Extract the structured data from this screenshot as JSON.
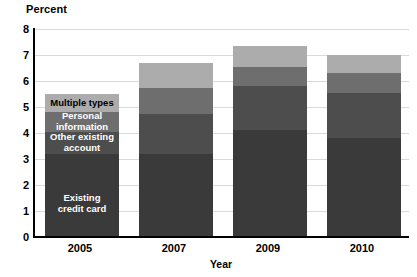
{
  "chart_data": {
    "type": "bar",
    "subtype": "stacked-vertical",
    "title": "",
    "xlabel": "Year",
    "ylabel": "Percent",
    "categories": [
      "2005",
      "2007",
      "2009",
      "2010"
    ],
    "ylim": [
      0,
      8
    ],
    "yticks": [
      "0",
      "1",
      "2",
      "3",
      "4",
      "5",
      "6",
      "7",
      "8"
    ],
    "grid": true,
    "legend_position": "in-bar-labels-first-category",
    "series": [
      {
        "name": "Existing credit card",
        "color": "#3a3a3a",
        "values": [
          3.2,
          3.2,
          4.1,
          3.8
        ]
      },
      {
        "name": "Other existing account",
        "color": "#4d4d4d",
        "values": [
          0.85,
          1.55,
          1.7,
          1.75
        ]
      },
      {
        "name": "Personal information",
        "color": "#6e6e6e",
        "values": [
          0.75,
          1.0,
          0.75,
          0.75
        ]
      },
      {
        "name": "Multiple types",
        "color": "#acacac",
        "values": [
          0.7,
          0.95,
          0.8,
          0.7
        ]
      }
    ],
    "totals": [
      5.5,
      6.7,
      7.35,
      7.0
    ]
  },
  "axes": {
    "y_title": "Percent",
    "x_title": "Year"
  }
}
